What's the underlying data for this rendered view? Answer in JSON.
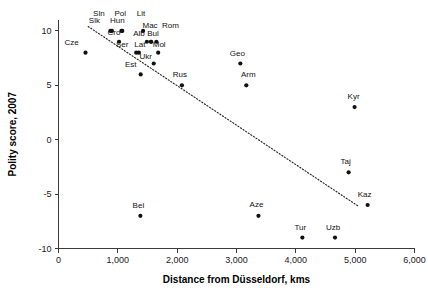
{
  "chart_data": {
    "type": "scatter",
    "title": "",
    "xlabel": "Distance from Düsseldorf, kms",
    "ylabel": "Polity score, 2007",
    "xlim": [
      0,
      6000
    ],
    "ylim": [
      -10,
      11
    ],
    "grid": false,
    "legend": "none",
    "xticks": [
      0,
      1000,
      2000,
      3000,
      4000,
      5000,
      6000
    ],
    "xticklabels": [
      "0",
      "1,000",
      "2,000",
      "3,000",
      "4,000",
      "5,000",
      "6,000"
    ],
    "yticks": [
      10,
      5,
      0,
      -5,
      -10
    ],
    "yticklabels": [
      "10",
      "5",
      "0",
      "-5",
      "-10"
    ],
    "marker_color": "#111111",
    "trendline": {
      "style": "dotted",
      "x_start": 500,
      "y_start": 10.4,
      "x_end": 5050,
      "y_end": -6.1
    },
    "points": [
      {
        "label": "Cze",
        "x": 455,
        "y": 8,
        "lx": -14,
        "ly": -8
      },
      {
        "label": "Sln",
        "x": 900,
        "y": 10,
        "lx": -13,
        "ly": -15
      },
      {
        "label": "Slk",
        "x": 875,
        "y": 10,
        "lx": -16,
        "ly": -8
      },
      {
        "label": "Pol",
        "x": 1075,
        "y": 10,
        "lx": -2,
        "ly": -15
      },
      {
        "label": "Hun",
        "x": 1060,
        "y": 10,
        "lx": -4,
        "ly": -8
      },
      {
        "label": "Cro",
        "x": 1020,
        "y": 9,
        "lx": -5,
        "ly": -7
      },
      {
        "label": "Ser",
        "x": 1310,
        "y": 8,
        "lx": -14,
        "ly": -6
      },
      {
        "label": "Lat",
        "x": 1355,
        "y": 8,
        "lx": 1,
        "ly": -6
      },
      {
        "label": "Lit",
        "x": 1425,
        "y": 10,
        "lx": -2,
        "ly": -15
      },
      {
        "label": "Alb",
        "x": 1490,
        "y": 9,
        "lx": -8,
        "ly": -6
      },
      {
        "label": "Mac",
        "x": 1560,
        "y": 9,
        "lx": -1,
        "ly": -14
      },
      {
        "label": "Bul",
        "x": 1560,
        "y": 9,
        "lx": 2,
        "ly": -6
      },
      {
        "label": "Rom",
        "x": 1650,
        "y": 9,
        "lx": 14,
        "ly": -14
      },
      {
        "label": "Mol",
        "x": 1680,
        "y": 8,
        "lx": 1,
        "ly": -6
      },
      {
        "label": "Ukr",
        "x": 1605,
        "y": 7,
        "lx": -8,
        "ly": -5
      },
      {
        "label": "Est",
        "x": 1385,
        "y": 6,
        "lx": -10,
        "ly": -7
      },
      {
        "label": "Rus",
        "x": 2080,
        "y": 5,
        "lx": -2,
        "ly": -8
      },
      {
        "label": "Geo",
        "x": 3065,
        "y": 7,
        "lx": -3,
        "ly": -8
      },
      {
        "label": "Arm",
        "x": 3165,
        "y": 5,
        "lx": 2,
        "ly": -8
      },
      {
        "label": "Kyr",
        "x": 4990,
        "y": 3,
        "lx": -1,
        "ly": -8
      },
      {
        "label": "Taj",
        "x": 4890,
        "y": -3,
        "lx": -3,
        "ly": -8
      },
      {
        "label": "Kaz",
        "x": 5210,
        "y": -6,
        "lx": -3,
        "ly": -8
      },
      {
        "label": "Bel",
        "x": 1380,
        "y": -7,
        "lx": -2,
        "ly": -8
      },
      {
        "label": "Aze",
        "x": 3370,
        "y": -7,
        "lx": -2,
        "ly": -9
      },
      {
        "label": "Tur",
        "x": 4110,
        "y": -9,
        "lx": -2,
        "ly": -8
      },
      {
        "label": "Uzb",
        "x": 4660,
        "y": -9,
        "lx": -2,
        "ly": -8
      }
    ]
  }
}
